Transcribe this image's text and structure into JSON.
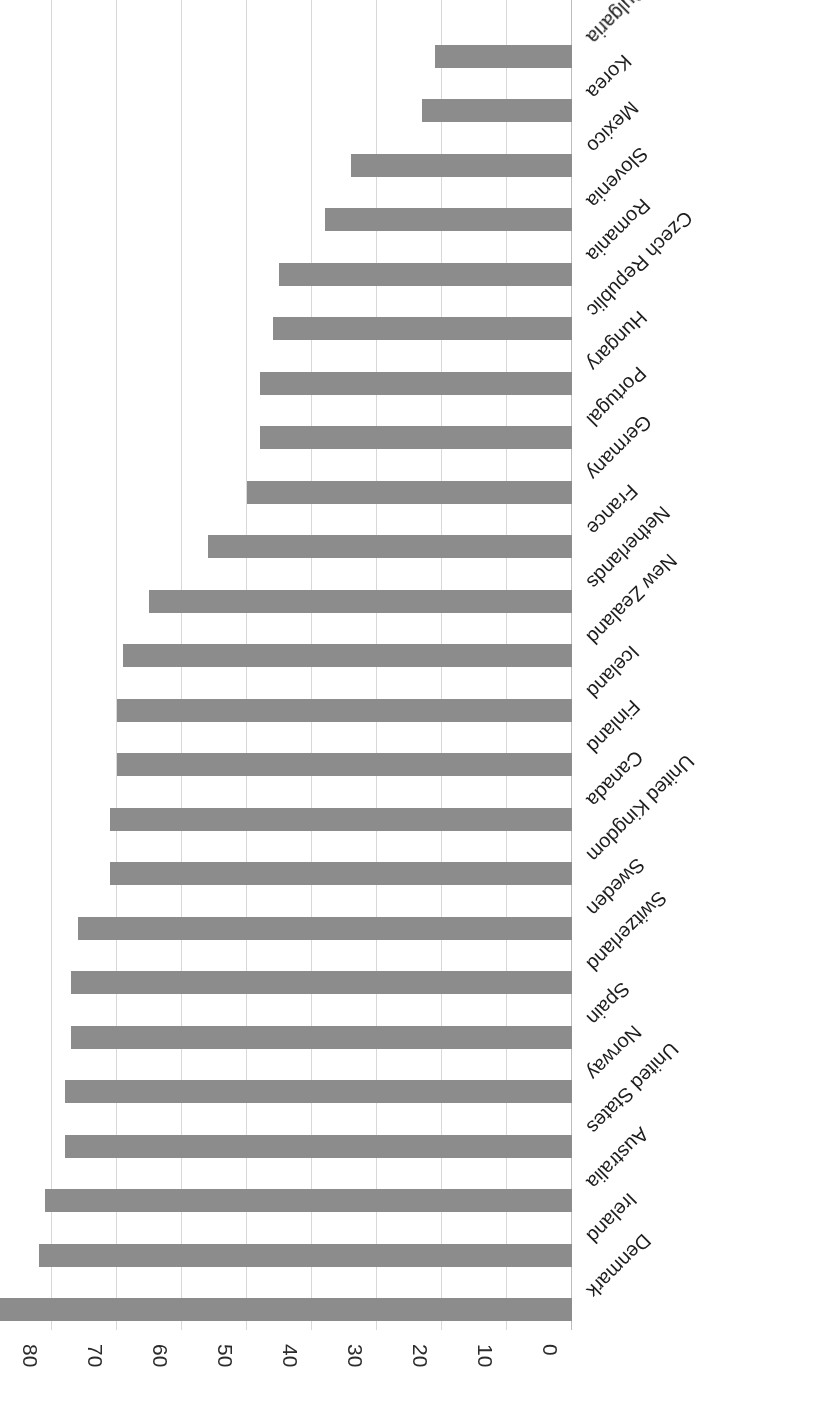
{
  "chart_data": {
    "type": "bar",
    "orientation": "horizontal-rotated-180",
    "title": "",
    "subtitle": "",
    "xlabel": "",
    "ylabel": "",
    "categories": [
      "Denmark",
      "Ireland",
      "Australia",
      "United States",
      "Norway",
      "Spain",
      "Switzerland",
      "Sweden",
      "United Kingdom",
      "Canada",
      "Finland",
      "Iceland",
      "New Zealand",
      "Netherlands",
      "France",
      "Germany",
      "Portugal",
      "Hungary",
      "Czech Republic",
      "Romania",
      "Slovenia",
      "Mexico",
      "Korea",
      "Bulgaria"
    ],
    "values": [
      92,
      82,
      81,
      78,
      78,
      77,
      77,
      76,
      71,
      71,
      70,
      70,
      69,
      65,
      56,
      50,
      48,
      48,
      46,
      45,
      38,
      34,
      23,
      21
    ],
    "axis_ticks": [
      100,
      90,
      80,
      70,
      60,
      50,
      40,
      30,
      20,
      10,
      0
    ],
    "ylim": [
      0,
      100
    ],
    "grid": true,
    "legend": false,
    "legend_position": "none",
    "bar_color": "#8c8c8c",
    "gridline_color": "#d8d8d8",
    "text_color": "#1d1d1d"
  }
}
